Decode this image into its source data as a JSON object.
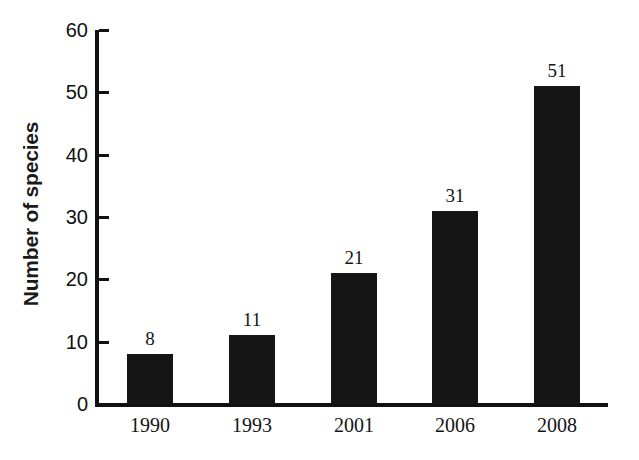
{
  "chart_data": {
    "type": "bar",
    "title": "",
    "subtitle": "",
    "xlabel": "",
    "ylabel": "Number of species",
    "categories": [
      "1990",
      "1993",
      "2001",
      "2006",
      "2008"
    ],
    "values": [
      8,
      11,
      21,
      31,
      51
    ],
    "value_labels": [
      "8",
      "11",
      "21",
      "31",
      "51"
    ],
    "series": [
      {
        "name": "Number of species",
        "values": [
          8,
          11,
          21,
          31,
          51
        ]
      }
    ],
    "ylim": [
      0,
      60
    ],
    "ytick_labels": [
      "60",
      "50",
      "40",
      "30",
      "20",
      "10",
      "0"
    ],
    "ytick_values": [
      60,
      50,
      40,
      30,
      20,
      10,
      0
    ],
    "ytick_interval": 10,
    "grid": false,
    "legend": false,
    "legend_position": "none",
    "tick_direction": "in",
    "bar_color": "#151515",
    "axis_color": "#111111",
    "background_color": "#ffffff",
    "data_labels_shown": true
  }
}
